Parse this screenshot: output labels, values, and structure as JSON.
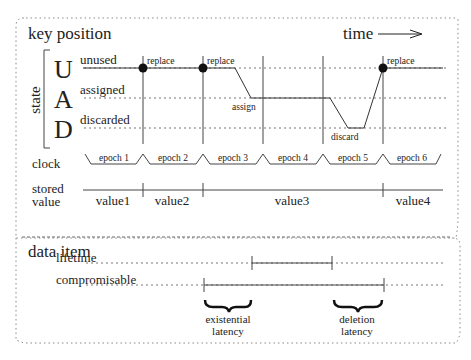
{
  "key_position": {
    "title": "key position",
    "time_label": "time",
    "state_axis_label": "state",
    "states": [
      {
        "letter": "U",
        "label": "unused"
      },
      {
        "letter": "A",
        "label": "assigned"
      },
      {
        "letter": "D",
        "label": "discarded"
      }
    ],
    "events": {
      "replace_1": "replace",
      "replace_2": "replace",
      "assign": "assign",
      "discard": "discard",
      "replace_3": "replace"
    },
    "clock_label": "clock",
    "epochs": [
      "epoch 1",
      "epoch 2",
      "epoch 3",
      "epoch 4",
      "epoch 5",
      "epoch 6"
    ],
    "stored_value_label_1": "stored",
    "stored_value_label_2": "value",
    "values": [
      "value1",
      "value2",
      "value3",
      "value4"
    ]
  },
  "data_item": {
    "title": "data item",
    "lifetime_label": "lifetime",
    "compromisable_label": "compromisable",
    "existential_latency_1": "existential",
    "existential_latency_2": "latency",
    "deletion_latency_1": "deletion",
    "deletion_latency_2": "latency"
  }
}
